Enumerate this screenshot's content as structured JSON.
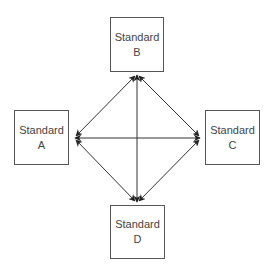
{
  "diagram": {
    "nodes": [
      {
        "id": "B",
        "title": "Standard",
        "label": "B"
      },
      {
        "id": "A",
        "title": "Standard",
        "label": "A"
      },
      {
        "id": "C",
        "title": "Standard",
        "label": "C"
      },
      {
        "id": "D",
        "title": "Standard",
        "label": "D"
      }
    ],
    "edges": [
      {
        "from": "A",
        "to": "B",
        "bidirectional": true
      },
      {
        "from": "B",
        "to": "C",
        "bidirectional": true
      },
      {
        "from": "C",
        "to": "D",
        "bidirectional": true
      },
      {
        "from": "D",
        "to": "A",
        "bidirectional": true
      },
      {
        "from": "A",
        "to": "C",
        "bidirectional": true
      },
      {
        "from": "B",
        "to": "D",
        "bidirectional": true
      }
    ],
    "colors": {
      "stroke": "#333333",
      "box_border": "#555555",
      "text": "#444444"
    }
  }
}
